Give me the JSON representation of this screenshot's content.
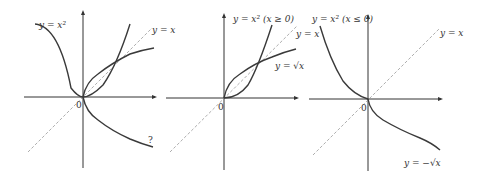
{
  "panels": [
    {
      "id": "panel-1",
      "labels": {
        "parabola": "y = x²",
        "diagonal": "y = x",
        "origin": "0",
        "unknown": "?"
      }
    },
    {
      "id": "panel-2",
      "labels": {
        "parabola": "y = x² (x ≥ 0)",
        "diagonal": "y = x",
        "sqrt": "y = √x",
        "origin": "0"
      }
    },
    {
      "id": "panel-3",
      "labels": {
        "parabola": "y = x² (x ≤ 0)",
        "diagonal": "y = x",
        "neg_sqrt": "y = −√x",
        "origin": "0"
      }
    }
  ],
  "colors": {
    "axis": "#333333",
    "curve": "#3a3a3a",
    "diagonal": "#999999"
  }
}
